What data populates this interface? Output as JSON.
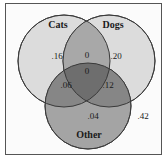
{
  "diagram": {
    "type": "venn",
    "sets": [
      {
        "name": "Cats",
        "only_value": ".16"
      },
      {
        "name": "Dogs",
        "only_value": ".20"
      },
      {
        "name": "Other",
        "only_value": ".04"
      }
    ],
    "intersections": {
      "cats_dogs_only": "0",
      "cats_dogs_other": "0",
      "cats_other_only": ".06",
      "dogs_other_only": ".12"
    },
    "outside_value": ".42",
    "colors": {
      "cats": "#d9d9d9",
      "dogs": "#d9d9d9",
      "other": "#9a9a9a",
      "stroke": "#444444"
    }
  }
}
